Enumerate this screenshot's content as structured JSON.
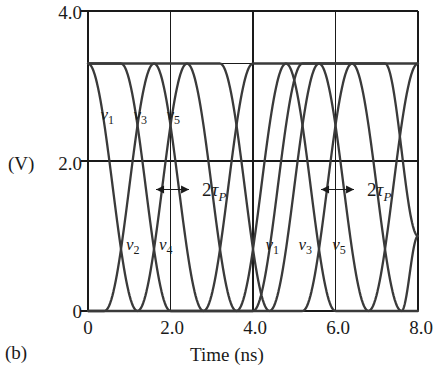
{
  "panel": {
    "label": "(b)"
  },
  "axes": {
    "y_unit_label": "(V)",
    "x_title": "Time (ns)",
    "y_ticks": [
      {
        "value": 4.0,
        "label": "4.0"
      },
      {
        "value": 2.0,
        "label": "2.0"
      },
      {
        "value": 0.0,
        "label": "0"
      }
    ],
    "x_ticks": [
      {
        "value": 0.0,
        "label": "0"
      },
      {
        "value": 2.0,
        "label": "2.0"
      },
      {
        "value": 4.0,
        "label": "4.0"
      },
      {
        "value": 6.0,
        "label": "6.0"
      },
      {
        "value": 8.0,
        "label": "8.0"
      }
    ],
    "gridlines_vertical_at": [
      2.0,
      4.0,
      6.0
    ],
    "gridlines_horizontal_at": [
      2.0,
      3.3
    ]
  },
  "annotations": [
    {
      "name": "delay-left",
      "text_prefix": "2",
      "symbol": "τ",
      "subscript": "P",
      "x_start": 1.65,
      "x_end": 2.45,
      "y": 1.62
    },
    {
      "name": "delay-right",
      "text_prefix": "2",
      "symbol": "τ",
      "subscript": "P",
      "x_start": 5.65,
      "x_end": 6.45,
      "y": 1.62
    }
  ],
  "curve_labels": [
    {
      "name": "v1-top",
      "text": "v",
      "sub": "1",
      "x": 0.3,
      "y": 2.62
    },
    {
      "name": "v3-top",
      "text": "v",
      "sub": "3",
      "x": 1.1,
      "y": 2.62
    },
    {
      "name": "v5-top",
      "text": "v",
      "sub": "5",
      "x": 1.9,
      "y": 2.62
    },
    {
      "name": "v2-bottom",
      "text": "v",
      "sub": "2",
      "x": 0.92,
      "y": 0.88
    },
    {
      "name": "v4-bottom",
      "text": "v",
      "sub": "4",
      "x": 1.72,
      "y": 0.88
    },
    {
      "name": "v1-bottom",
      "text": "v",
      "sub": "1",
      "x": 4.3,
      "y": 0.88
    },
    {
      "name": "v3-bottom",
      "text": "v",
      "sub": "3",
      "x": 5.1,
      "y": 0.88
    },
    {
      "name": "v5-bottom",
      "text": "v",
      "sub": "5",
      "x": 5.92,
      "y": 0.88
    }
  ],
  "style": {
    "curve_color": "#3a3a3a",
    "axis_color": "#1a1a1a",
    "background": "#ffffff"
  },
  "chart_data": {
    "type": "line",
    "title": "",
    "xlabel": "Time (ns)",
    "ylabel": "(V)",
    "xlim": [
      0,
      8
    ],
    "ylim": [
      0,
      4
    ],
    "xticks": [
      0,
      2,
      4,
      6,
      8
    ],
    "yticks": [
      0,
      2,
      4
    ],
    "grid": true,
    "legend": "inline-curve-labels",
    "vdd": 3.3,
    "stage_delay_tau_p": 0.4,
    "oscillation_period": 4.0,
    "transition_time": 1.2,
    "series": [
      {
        "name": "v1",
        "initial_level": 3.3,
        "first_transition_start": 0.0,
        "edges": [
          {
            "t_start": 0.0,
            "t_end": 1.2,
            "from": 3.3,
            "to": 0.0
          },
          {
            "t_start": 4.0,
            "t_end": 5.2,
            "from": 0.0,
            "to": 3.3
          }
        ]
      },
      {
        "name": "v2",
        "initial_level": 0.0,
        "first_transition_start": 0.4,
        "edges": [
          {
            "t_start": 0.4,
            "t_end": 1.6,
            "from": 0.0,
            "to": 3.3
          },
          {
            "t_start": 2.4,
            "t_end": 3.6,
            "from": 3.3,
            "to": 0.0
          },
          {
            "t_start": 4.4,
            "t_end": 5.6,
            "from": 0.0,
            "to": 3.3
          },
          {
            "t_start": 6.4,
            "t_end": 7.6,
            "from": 3.3,
            "to": 0.0
          }
        ]
      },
      {
        "name": "v3",
        "initial_level": 3.3,
        "first_transition_start": 0.8,
        "edges": [
          {
            "t_start": 0.8,
            "t_end": 2.0,
            "from": 3.3,
            "to": 0.0
          },
          {
            "t_start": 2.8,
            "t_end": 4.0,
            "from": 0.0,
            "to": 3.3
          },
          {
            "t_start": 4.8,
            "t_end": 6.0,
            "from": 3.3,
            "to": 0.0
          },
          {
            "t_start": 6.8,
            "t_end": 8.0,
            "from": 0.0,
            "to": 3.3
          }
        ]
      },
      {
        "name": "v4",
        "initial_level": 0.0,
        "first_transition_start": 1.2,
        "edges": [
          {
            "t_start": 1.2,
            "t_end": 2.4,
            "from": 0.0,
            "to": 3.3
          },
          {
            "t_start": 3.2,
            "t_end": 4.4,
            "from": 3.3,
            "to": 0.0
          },
          {
            "t_start": 5.2,
            "t_end": 6.4,
            "from": 0.0,
            "to": 3.3
          },
          {
            "t_start": 7.2,
            "t_end": 8.0,
            "from": 3.3,
            "to": 1.0
          }
        ]
      },
      {
        "name": "v5",
        "initial_level": 3.3,
        "first_transition_start": 1.6,
        "edges": [
          {
            "t_start": 1.6,
            "t_end": 2.8,
            "from": 3.3,
            "to": 0.0
          },
          {
            "t_start": 3.6,
            "t_end": 4.8,
            "from": 0.0,
            "to": 3.3
          },
          {
            "t_start": 5.6,
            "t_end": 6.8,
            "from": 3.3,
            "to": 0.0
          },
          {
            "t_start": 7.6,
            "t_end": 8.0,
            "from": 0.0,
            "to": 1.0
          }
        ]
      }
    ]
  }
}
